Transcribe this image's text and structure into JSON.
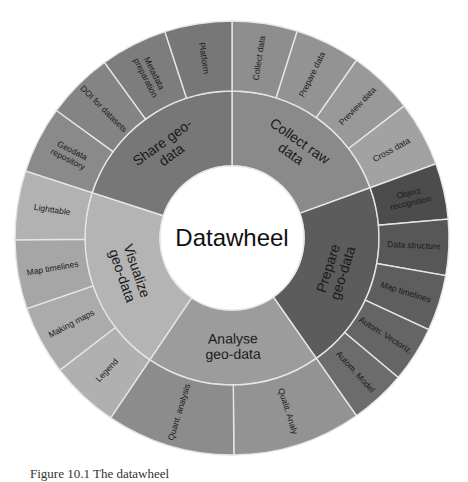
{
  "diagram": {
    "type": "sunburst",
    "center": {
      "cx": 232,
      "cy": 238
    },
    "radii": {
      "hub": 72,
      "inner": 147,
      "outer": 217
    },
    "hub_label": "Datawheel",
    "hub_color": "#ffffff",
    "sectors": [
      {
        "label": [
          "Collect raw",
          "data"
        ],
        "start": 0,
        "end": 70,
        "color": "#8a8a8a",
        "children": [
          {
            "label": [
              "Collect data"
            ],
            "color": "#8e8e8e"
          },
          {
            "label": [
              "Prepare data"
            ],
            "color": "#939393"
          },
          {
            "label": [
              "Preview data"
            ],
            "color": "#999999"
          },
          {
            "label": [
              "Cross data"
            ],
            "color": "#a2a2a2"
          }
        ]
      },
      {
        "label": [
          "Prepare",
          "geo-data"
        ],
        "start": 70,
        "end": 145,
        "color": "#5c5c5c",
        "children": [
          {
            "label": [
              "Object",
              "recognition"
            ],
            "color": "#4c4c4c"
          },
          {
            "label": [
              "Data structure"
            ],
            "color": "#575757"
          },
          {
            "label": [
              "Map timelines"
            ],
            "color": "#5e5e5e"
          },
          {
            "label": [
              "Autom. Vectoriz."
            ],
            "color": "#656565"
          },
          {
            "label": [
              "Autom. Model"
            ],
            "color": "#6c6c6c"
          }
        ]
      },
      {
        "label": [
          "Analyse",
          "geo-data"
        ],
        "start": 145,
        "end": 214,
        "color": "#9c9c9c",
        "children": [
          {
            "label": [
              "Qualit. Analy"
            ],
            "color": "#939393"
          },
          {
            "label": [
              "Quant. analysis"
            ],
            "color": "#8c8c8c"
          }
        ]
      },
      {
        "label": [
          "Visualize",
          "geo-data"
        ],
        "start": 214,
        "end": 288,
        "color": "#b4b4b4",
        "children": [
          {
            "label": [
              "Legend"
            ],
            "color": "#b0b0b0"
          },
          {
            "label": [
              "Making maps"
            ],
            "color": "#ababab"
          },
          {
            "label": [
              "Map timelines"
            ],
            "color": "#a6a6a6"
          },
          {
            "label": [
              "Lighttable"
            ],
            "color": "#b2b2b2"
          }
        ]
      },
      {
        "label": [
          "Share geo-",
          "data"
        ],
        "start": 288,
        "end": 360,
        "color": "#777777",
        "children": [
          {
            "label": [
              "Geodata",
              "repository"
            ],
            "color": "#8a8a8a"
          },
          {
            "label": [
              "DOI for datasets"
            ],
            "color": "#848484"
          },
          {
            "label": [
              "Metadata",
              "preparation"
            ],
            "color": "#7d7d7d"
          },
          {
            "label": [
              "Platform"
            ],
            "color": "#777777"
          }
        ]
      }
    ],
    "divider_color": "#e6e6e6"
  },
  "caption": "Figure 10.1 The datawheel"
}
